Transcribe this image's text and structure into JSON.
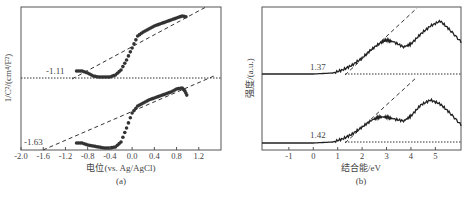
{
  "chart_data": [
    {
      "panel": "(a)",
      "type": "scatter",
      "title": "",
      "xlabel": "电位(vs. Ag/AgCl)",
      "ylabel": "1/C²/(cm⁴/F²)",
      "xlim": [
        -2.0,
        1.6
      ],
      "xticks": [
        "-2.0",
        "-1.6",
        "-1.2",
        "-0.8",
        "-0.4",
        "0.0",
        "0.4",
        "0.8",
        "1.2"
      ],
      "grid": false,
      "series": [
        {
          "name": "upper",
          "x": [
            -1.0,
            -0.9,
            -0.8,
            -0.7,
            -0.6,
            -0.5,
            -0.4,
            -0.3,
            -0.2,
            -0.1,
            0.0,
            0.1,
            0.2,
            0.3,
            0.4,
            0.5,
            0.6,
            0.7,
            0.8,
            0.9,
            1.0
          ],
          "y_px": [
            71,
            71,
            73,
            76,
            77,
            77,
            77,
            75,
            70,
            60,
            48,
            36,
            32,
            29,
            26,
            24,
            22,
            20,
            18,
            16,
            17
          ],
          "tangent_intercept": -1.11
        },
        {
          "name": "lower",
          "x": [
            -1.0,
            -0.9,
            -0.8,
            -0.7,
            -0.6,
            -0.5,
            -0.4,
            -0.3,
            -0.2,
            -0.1,
            0.0,
            0.1,
            0.2,
            0.3,
            0.4,
            0.5,
            0.6,
            0.7,
            0.8,
            0.9,
            0.95,
            1.0
          ],
          "y_px": [
            143,
            143,
            145,
            146,
            147,
            148,
            148,
            147,
            142,
            128,
            113,
            106,
            103,
            100,
            98,
            96,
            94,
            92,
            89,
            88,
            91,
            97
          ],
          "tangent_intercept": -1.63
        }
      ],
      "annotations": [
        "-1.11",
        "-1.63"
      ]
    },
    {
      "panel": "(b)",
      "type": "line",
      "title": "",
      "xlabel": "结合能/eV",
      "ylabel": "强度/(a.u.)",
      "xlim": [
        -2.1,
        6.05
      ],
      "xticks": [
        "-1",
        "0",
        "1",
        "2",
        "3",
        "4",
        "5"
      ],
      "grid": false,
      "series": [
        {
          "name": "upper",
          "x": [
            -2.1,
            0.0,
            0.8,
            1.2,
            1.6,
            2.0,
            2.4,
            2.8,
            3.0,
            3.3,
            3.7,
            4.0,
            4.4,
            4.8,
            5.2,
            5.6,
            6.05
          ],
          "y_px": [
            74,
            74,
            73,
            70,
            65,
            58,
            49,
            42,
            40,
            42,
            47,
            44,
            34,
            26,
            21,
            30,
            42
          ],
          "tangent_intercept": 1.37
        },
        {
          "name": "lower",
          "x": [
            -2.1,
            0.0,
            0.8,
            1.2,
            1.6,
            2.0,
            2.4,
            2.7,
            3.0,
            3.3,
            3.7,
            4.0,
            4.4,
            4.8,
            5.2,
            5.6,
            6.05
          ],
          "y_px": [
            143,
            143,
            142,
            139,
            134,
            127,
            120,
            117,
            117,
            119,
            121,
            116,
            105,
            100,
            104,
            113,
            125
          ],
          "tangent_intercept": 1.42
        }
      ],
      "annotations": [
        "1.37",
        "1.42"
      ]
    }
  ],
  "panels": {
    "a": {
      "ylabel": "1/C²/(cm⁴/F²)",
      "xlabel": "电位(vs. Ag/AgCl)",
      "tag": "(a)",
      "ann_upper": "-1.11",
      "ann_lower": "-1.63",
      "ticks": [
        "-2.0",
        "-1.6",
        "-1.2",
        "-0.8",
        "-0.4",
        "0.0",
        "0.4",
        "0.8",
        "1.2"
      ]
    },
    "b": {
      "ylabel": "强度/(a.u.)",
      "xlabel": "结合能/eV",
      "tag": "(b)",
      "ann_upper": "1.37",
      "ann_lower": "1.42",
      "ticks": [
        "-1",
        "0",
        "1",
        "2",
        "3",
        "4",
        "5"
      ]
    }
  }
}
